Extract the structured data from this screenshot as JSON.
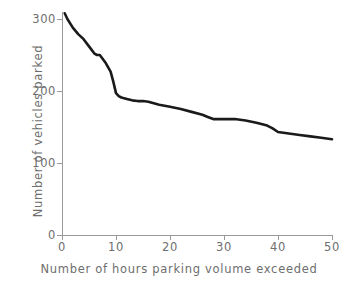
{
  "chart_data": {
    "type": "line",
    "title": "",
    "subtitle": "",
    "xlabel": "Number of hours parking volume exceeded",
    "ylabel": "Number of vehicles parked",
    "xlim": [
      0,
      50
    ],
    "ylim": [
      0,
      320
    ],
    "xticks": [
      0,
      10,
      20,
      30,
      40,
      50
    ],
    "yticks": [
      0,
      100,
      200,
      300
    ],
    "xtick_labels": [
      "0",
      "10",
      "20",
      "30",
      "40",
      "50"
    ],
    "ytick_labels": [
      "0",
      "100",
      "200",
      "300"
    ],
    "grid": false,
    "legend": null,
    "legend_position": "none",
    "series": [
      {
        "name": "Parking volume exceedance",
        "color": "#1a1a1a",
        "line_width": 2.6,
        "markers": false,
        "x": [
          0.5,
          1,
          2,
          3,
          4,
          5,
          6,
          6.5,
          7,
          8,
          9,
          9.5,
          10,
          10.5,
          11,
          12,
          13,
          14,
          15,
          16,
          17,
          18,
          20,
          22,
          24,
          26,
          27,
          28,
          30,
          32,
          33,
          34,
          36,
          38,
          39,
          40,
          42,
          44,
          46,
          48,
          50
        ],
        "y": [
          308,
          300,
          288,
          279,
          272,
          262,
          252,
          250,
          250,
          240,
          227,
          213,
          197,
          193,
          191,
          189,
          187,
          186,
          186,
          185,
          183,
          181,
          178,
          175,
          171,
          167,
          164,
          161,
          161,
          161,
          160,
          159,
          156,
          152,
          148,
          143,
          141,
          139,
          137,
          135,
          133
        ]
      }
    ],
    "annotations": []
  },
  "axes": {
    "y_tick_items": [
      {
        "label": "300",
        "value": 300
      },
      {
        "label": "200",
        "value": 200
      },
      {
        "label": "100",
        "value": 100
      },
      {
        "label": "0",
        "value": 0
      }
    ],
    "x_tick_items": [
      {
        "label": "0",
        "value": 0
      },
      {
        "label": "10",
        "value": 10
      },
      {
        "label": "20",
        "value": 20
      },
      {
        "label": "30",
        "value": 30
      },
      {
        "label": "40",
        "value": 40
      },
      {
        "label": "50",
        "value": 50
      }
    ]
  },
  "style": {
    "axis_color": "#9a9a9a",
    "text_color": "#6e6e6e",
    "line_color": "#1a1a1a",
    "background": "#ffffff"
  }
}
